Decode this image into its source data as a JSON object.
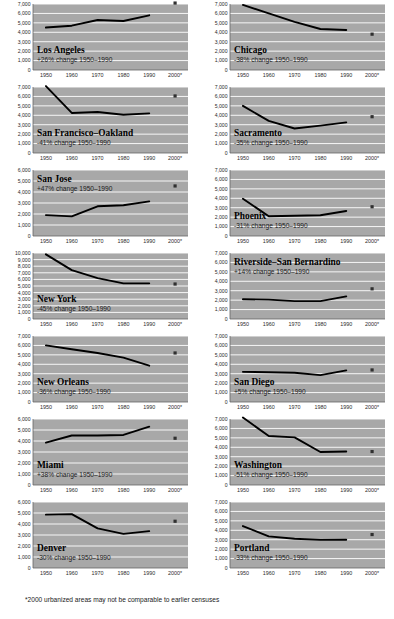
{
  "footnote": "*2000 urbanized areas may not be comparable to earlier censuses",
  "style": {
    "plot_bg": "#a8a8a8",
    "gridline": "#ffffff",
    "line_color": "#000000",
    "marker_color": "#303030",
    "axis_color": "#666666"
  },
  "chart_data": [
    {
      "type": "line",
      "title": "Los Angeles",
      "annotation": "+26% change 1950–1990",
      "xlabel": "",
      "ylabel": "",
      "x": [
        1950,
        1960,
        1970,
        1980,
        1990
      ],
      "values": [
        4500,
        4700,
        5300,
        5200,
        5800
      ],
      "marker_2000": 7100,
      "xticks": [
        "1950",
        "1960",
        "1970",
        "1980",
        "1990",
        "2000*"
      ],
      "yticks": [
        "0",
        "1,000",
        "2,000",
        "3,000",
        "4,000",
        "5,000",
        "6,000",
        "7,000"
      ],
      "ylim": [
        0,
        7000
      ],
      "grid": true,
      "legend": "none"
    },
    {
      "type": "line",
      "title": "Chicago",
      "annotation": "-38% change 1950–1990",
      "xlabel": "",
      "ylabel": "",
      "x": [
        1950,
        1960,
        1970,
        1980,
        1990
      ],
      "values": [
        6900,
        6000,
        5100,
        4350,
        4250
      ],
      "marker_2000": 3800,
      "xticks": [
        "1950",
        "1960",
        "1970",
        "1980",
        "1990",
        "2000*"
      ],
      "yticks": [
        "0",
        "1,000",
        "2,000",
        "3,000",
        "4,000",
        "5,000",
        "6,000",
        "7,000"
      ],
      "ylim": [
        0,
        7000
      ],
      "grid": true,
      "legend": "none"
    },
    {
      "type": "line",
      "title": "San Francisco–Oakland",
      "annotation": "-41% change 1950–1990",
      "xlabel": "",
      "ylabel": "",
      "x": [
        1950,
        1960,
        1970,
        1980,
        1990
      ],
      "values": [
        7100,
        4250,
        4350,
        4050,
        4200
      ],
      "marker_2000": 6050,
      "xticks": [
        "1950",
        "1960",
        "1970",
        "1980",
        "1990",
        "2000*"
      ],
      "yticks": [
        "0",
        "1,000",
        "2,000",
        "3,000",
        "4,000",
        "5,000",
        "6,000",
        "7,000"
      ],
      "ylim": [
        0,
        7000
      ],
      "grid": true,
      "legend": "none"
    },
    {
      "type": "line",
      "title": "Sacramento",
      "annotation": "-35% change 1950–1990",
      "xlabel": "",
      "ylabel": "",
      "x": [
        1950,
        1960,
        1970,
        1980,
        1990
      ],
      "values": [
        5000,
        3400,
        2600,
        2900,
        3250
      ],
      "marker_2000": 3850,
      "xticks": [
        "1950",
        "1960",
        "1970",
        "1980",
        "1990",
        "2000*"
      ],
      "yticks": [
        "0",
        "1,000",
        "2,000",
        "3,000",
        "4,000",
        "5,000",
        "6,000",
        "7,000"
      ],
      "ylim": [
        0,
        7000
      ],
      "grid": true,
      "legend": "none"
    },
    {
      "type": "line",
      "title": "San Jose",
      "annotation": "+47% change 1950–1990",
      "xlabel": "",
      "ylabel": "",
      "x": [
        1950,
        1960,
        1970,
        1980,
        1990
      ],
      "values": [
        1900,
        1780,
        2700,
        2800,
        3150
      ],
      "marker_2000": 4550,
      "xticks": [
        "1950",
        "1960",
        "1970",
        "1980",
        "1990",
        "2000*"
      ],
      "yticks": [
        "0",
        "1,000",
        "2,000",
        "3,000",
        "4,000",
        "5,000",
        "6,000"
      ],
      "ylim": [
        0,
        6000
      ],
      "grid": true,
      "legend": "none"
    },
    {
      "type": "line",
      "title": "Phoenix",
      "annotation": "-31% change 1950–1990",
      "xlabel": "",
      "ylabel": "",
      "x": [
        1950,
        1960,
        1970,
        1980,
        1990
      ],
      "values": [
        3950,
        2100,
        2150,
        2200,
        2650
      ],
      "marker_2000": 3100,
      "xticks": [
        "1950",
        "1960",
        "1970",
        "1980",
        "1990",
        "2000*"
      ],
      "yticks": [
        "0",
        "1,000",
        "2,000",
        "3,000",
        "4,000",
        "5,000",
        "6,000",
        "7,000"
      ],
      "ylim": [
        0,
        7000
      ],
      "grid": true,
      "legend": "none"
    },
    {
      "type": "line",
      "title": "New York",
      "annotation": "-45% change 1950–1990",
      "xlabel": "",
      "ylabel": "",
      "x": [
        1950,
        1960,
        1970,
        1980,
        1990
      ],
      "values": [
        9800,
        7400,
        6200,
        5400,
        5400
      ],
      "marker_2000": 5300,
      "xticks": [
        "1950",
        "1960",
        "1970",
        "1980",
        "1990",
        "2000*"
      ],
      "yticks": [
        "0",
        "1,000",
        "2,000",
        "3,000",
        "4,000",
        "5,000",
        "6,000",
        "7,000",
        "8,000",
        "9,000",
        "10,000"
      ],
      "ylim": [
        0,
        10000
      ],
      "grid": true,
      "legend": "none"
    },
    {
      "type": "line",
      "title": "Riverside–San Bernardino",
      "annotation": "+14% change 1950–1990",
      "xlabel": "",
      "ylabel": "",
      "x": [
        1950,
        1960,
        1970,
        1980,
        1990
      ],
      "values": [
        2100,
        2050,
        1900,
        1900,
        2400
      ],
      "marker_2000": 3200,
      "xticks": [
        "1950",
        "1960",
        "1970",
        "1980",
        "1990",
        "2000*"
      ],
      "yticks": [
        "0",
        "1,000",
        "2,000",
        "3,000",
        "4,000",
        "5,000",
        "6,000",
        "7,000"
      ],
      "ylim": [
        0,
        7000
      ],
      "grid": true,
      "legend": "none"
    },
    {
      "type": "line",
      "title": "New Orleans",
      "annotation": "-36% change 1950–1990",
      "xlabel": "",
      "ylabel": "",
      "x": [
        1950,
        1960,
        1970,
        1980,
        1990
      ],
      "values": [
        6000,
        5600,
        5200,
        4700,
        3850
      ],
      "marker_2000": 5200,
      "xticks": [
        "1950",
        "1960",
        "1970",
        "1980",
        "1990",
        "2000*"
      ],
      "yticks": [
        "0",
        "1,000",
        "2,000",
        "3,000",
        "4,000",
        "5,000",
        "6,000",
        "7,000"
      ],
      "ylim": [
        0,
        7000
      ],
      "grid": true,
      "legend": "none"
    },
    {
      "type": "line",
      "title": "San Diego",
      "annotation": "+5% change 1950–1990",
      "xlabel": "",
      "ylabel": "",
      "x": [
        1950,
        1960,
        1970,
        1980,
        1990
      ],
      "values": [
        3200,
        3150,
        3100,
        2850,
        3350
      ],
      "marker_2000": 3400,
      "xticks": [
        "1950",
        "1960",
        "1970",
        "1980",
        "1990",
        "2000*"
      ],
      "yticks": [
        "0",
        "1,000",
        "2,000",
        "3,000",
        "4,000",
        "5,000",
        "6,000",
        "7,000"
      ],
      "ylim": [
        0,
        7000
      ],
      "grid": true,
      "legend": "none"
    },
    {
      "type": "line",
      "title": "Miami",
      "annotation": "+38% change 1950–1990",
      "xlabel": "",
      "ylabel": "",
      "x": [
        1950,
        1960,
        1970,
        1980,
        1990
      ],
      "values": [
        3850,
        4500,
        4500,
        4550,
        5300
      ],
      "marker_2000": 4250,
      "xticks": [
        "1950",
        "1960",
        "1970",
        "1980",
        "1990",
        "2000*"
      ],
      "yticks": [
        "0",
        "1,000",
        "2,000",
        "3,000",
        "4,000",
        "5,000",
        "6,000"
      ],
      "ylim": [
        0,
        6000
      ],
      "grid": true,
      "legend": "none"
    },
    {
      "type": "line",
      "title": "Washington",
      "annotation": "-51% change 1950–1990",
      "xlabel": "",
      "ylabel": "",
      "x": [
        1950,
        1960,
        1970,
        1980,
        1990
      ],
      "values": [
        7150,
        5200,
        5050,
        3500,
        3550
      ],
      "marker_2000": 3550,
      "xticks": [
        "1950",
        "1960",
        "1970",
        "1980",
        "1990",
        "2000*"
      ],
      "yticks": [
        "0",
        "1,000",
        "2,000",
        "3,000",
        "4,000",
        "5,000",
        "6,000",
        "7,000"
      ],
      "ylim": [
        0,
        7000
      ],
      "grid": true,
      "legend": "none"
    },
    {
      "type": "line",
      "title": "Denver",
      "annotation": "-30% change 1950–1990",
      "xlabel": "",
      "ylabel": "",
      "x": [
        1950,
        1960,
        1970,
        1980,
        1990
      ],
      "values": [
        4850,
        4900,
        3600,
        3100,
        3350
      ],
      "marker_2000": 4250,
      "xticks": [
        "1950",
        "1960",
        "1970",
        "1980",
        "1990",
        "2000*"
      ],
      "yticks": [
        "0",
        "1,000",
        "2,000",
        "3,000",
        "4,000",
        "5,000",
        "6,000"
      ],
      "ylim": [
        0,
        6000
      ],
      "grid": true,
      "legend": "none"
    },
    {
      "type": "line",
      "title": "Portland",
      "annotation": "-33% change 1950–1990",
      "xlabel": "",
      "ylabel": "",
      "x": [
        1950,
        1960,
        1970,
        1980,
        1990
      ],
      "values": [
        4450,
        3350,
        3100,
        2980,
        3000
      ],
      "marker_2000": 3550,
      "xticks": [
        "1950",
        "1960",
        "1970",
        "1980",
        "1990",
        "2000*"
      ],
      "yticks": [
        "0",
        "1,000",
        "2,000",
        "3,000",
        "4,000",
        "5,000",
        "6,000",
        "7,000"
      ],
      "ylim": [
        0,
        7000
      ],
      "grid": true,
      "legend": "none"
    }
  ]
}
